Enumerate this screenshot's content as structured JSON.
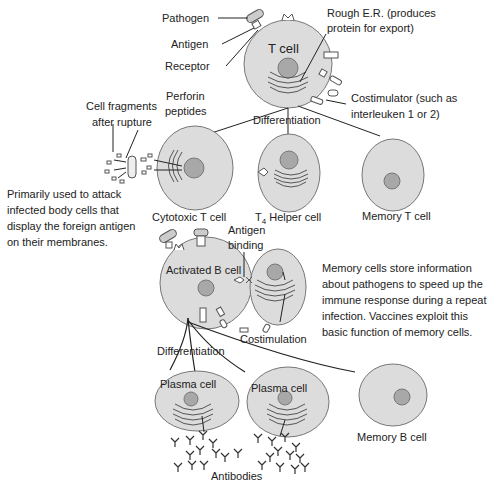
{
  "colors": {
    "cell_fill": "#dcdcdc",
    "cell_stroke": "#777777",
    "nucleus_fill": "#a8a8a8",
    "line": "#222222"
  },
  "t_cell": {
    "title": "T cell",
    "labels": {
      "pathogen": "Pathogen",
      "antigen": "Antigen",
      "receptor": "Receptor",
      "rough_er_line1": "Rough E.R. (produces",
      "rough_er_line2": "protein for export)",
      "costimulator_line1": "Costimulator (such as",
      "costimulator_line2": "interleuken 1 or 2)",
      "differentiation": "Differentiation"
    }
  },
  "t_descendants": {
    "cytotoxic": "Cytotoxic T cell",
    "helper_prefix": "T",
    "helper_sub": "4",
    "helper_suffix": " Helper cell",
    "memory": "Memory T cell",
    "perforin_line1": "Perforin",
    "perforin_line2": "peptides",
    "fragments_line1": "Cell fragments",
    "fragments_line2": "after rupture"
  },
  "cytotoxic_note": [
    "Primarily used to attack",
    "infected body cells that",
    "display the foreign antigen",
    "on their membranes."
  ],
  "b_cell": {
    "title": "Activated B cell",
    "antigen_binding_line1": "Antigen",
    "antigen_binding_line2": "binding",
    "costimulation": "Costimulation",
    "differentiation": "Differentiation"
  },
  "memory_note": [
    "Memory cells store information",
    "about pathogens to speed up the",
    "immune response during a repeat",
    "infection. Vaccines exploit this",
    "basic function of memory cells."
  ],
  "b_descendants": {
    "plasma1": "Plasma cell",
    "plasma2": "Plasma cell",
    "memory": "Memory B cell",
    "antibodies": "Antibodies"
  }
}
